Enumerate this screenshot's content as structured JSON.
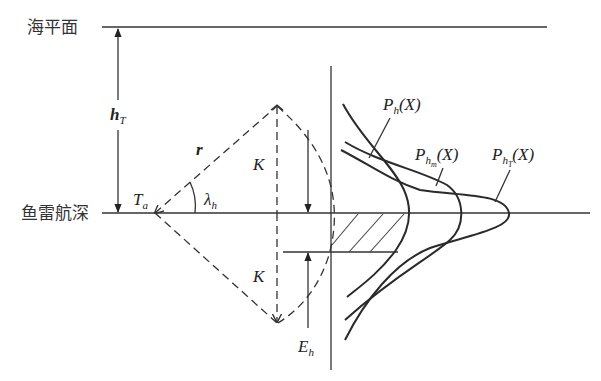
{
  "labels": {
    "sea_surface": "海平面",
    "torpedo_depth": "鱼雷航深",
    "h_T": {
      "main": "h",
      "sub": "T"
    },
    "r": "r",
    "T_a": {
      "main": "T",
      "sub": "a"
    },
    "lambda_h": {
      "main": "λ",
      "sub": "h"
    },
    "K_upper": "K",
    "K_lower": "K",
    "E_h": {
      "main": "E",
      "sub": "h"
    },
    "P_h": {
      "main": "P",
      "sub": "h",
      "arg": "(X)"
    },
    "P_hm": {
      "main": "P",
      "sub": "h",
      "subsub": "m",
      "arg": "(X)"
    },
    "P_hT": {
      "main": "P",
      "sub": "h",
      "subsub": "T",
      "arg": "(X)"
    }
  },
  "colors": {
    "line": "#333333",
    "background": "#ffffff"
  }
}
